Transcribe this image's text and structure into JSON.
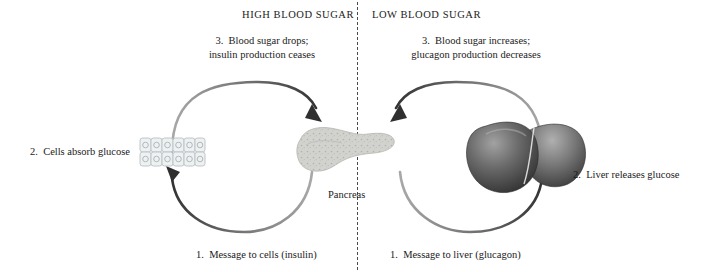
{
  "diagram": {
    "headings": {
      "left": "HIGH BLOOD SUGAR",
      "right": "LOW BLOOD SUGAR"
    },
    "left_cycle": {
      "step3_line1": "3.  Blood sugar drops;",
      "step3_line2": "insulin production ceases",
      "step2": "2.  Cells absorb glucose",
      "step1": "1.  Message to cells (insulin)"
    },
    "right_cycle": {
      "step3_line1": "3.  Blood sugar increases;",
      "step3_line2": "glucagon production decreases",
      "step2": "2.  Liver releases glucose",
      "step1": "1.  Message to liver (glucagon)"
    },
    "organs": {
      "pancreas_label": "Pancreas",
      "liver_label": "liver"
    },
    "colors": {
      "background": "#ffffff",
      "text": "#1a1a1a",
      "arrow_dark": "#3a3a3a",
      "arrow_light": "#9a9a9a",
      "divider": "#4a4a4a",
      "pancreas_fill": "#cfcfcb",
      "liver_dark": "#3e3e3e",
      "liver_light": "#8e8e8e",
      "cell_fill": "#eceff0",
      "cell_stroke": "#b9c0c2"
    }
  }
}
